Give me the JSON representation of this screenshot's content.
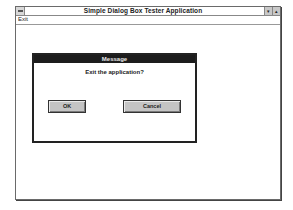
{
  "window": {
    "title": "Simple Dialog Box Tester Application",
    "controls": {
      "minimize": "▾",
      "maximize": "▴"
    }
  },
  "menubar": {
    "items": [
      {
        "label": "Exit"
      }
    ]
  },
  "dialog": {
    "title": "Message",
    "message": "Exit the application?",
    "buttons": {
      "ok": "OK",
      "cancel": "Cancel"
    }
  },
  "colors": {
    "dialog_title_bg": "#1c1c1c",
    "button_face": "#c4c4c4",
    "background": "#ffffff"
  }
}
